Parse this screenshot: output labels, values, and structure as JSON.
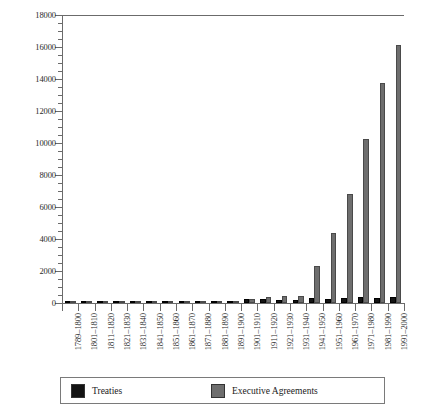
{
  "chart_data": {
    "type": "bar",
    "title": "",
    "subtitle": "",
    "xlabel": "",
    "ylabel": "",
    "ylim": [
      0,
      18000
    ],
    "ytick_step": 2000,
    "yminor_step": 500,
    "grid": false,
    "legend_position": "bottom",
    "yticks": [
      "0",
      "2000",
      "4000",
      "6000",
      "8000",
      "10000",
      "12000",
      "14000",
      "16000",
      "18000"
    ],
    "categories": [
      "1789–1800",
      "1801–1810",
      "1811–1820",
      "1821–1830",
      "1831–1840",
      "1841–1850",
      "1851–1860",
      "1861–1870",
      "1871–1880",
      "1881–1890",
      "1891–1900",
      "1901–1910",
      "1911–1920",
      "1921–1930",
      "1931–1940",
      "1941–1950",
      "1951–1960",
      "1961–1970",
      "1971–1980",
      "1981–1990",
      "1991–2000"
    ],
    "series": [
      {
        "name": "Treaties",
        "color": "#131313",
        "values": [
          60,
          27,
          33,
          32,
          41,
          52,
          62,
          53,
          72,
          99,
          118,
          224,
          272,
          204,
          161,
          292,
          256,
          287,
          372,
          283,
          387
        ]
      },
      {
        "name": "Executive Agreements",
        "color": "#6e6e6e",
        "values": [
          27,
          19,
          33,
          29,
          21,
          29,
          33,
          50,
          57,
          58,
          101,
          252,
          365,
          435,
          428,
          2295,
          4372,
          6823,
          10232,
          13758,
          16135
        ]
      }
    ]
  },
  "legend": {
    "entries": [
      {
        "label": "Treaties",
        "color": "#131313",
        "swatch": "black-square-swatch"
      },
      {
        "label": "Executive Agreements",
        "color": "#6e6e6e",
        "swatch": "gray-square-swatch"
      }
    ]
  },
  "colors": {
    "treaties": "#131313",
    "executive_agreements": "#6e6e6e",
    "axis": "#6b6b6b",
    "background": "#ffffff"
  }
}
